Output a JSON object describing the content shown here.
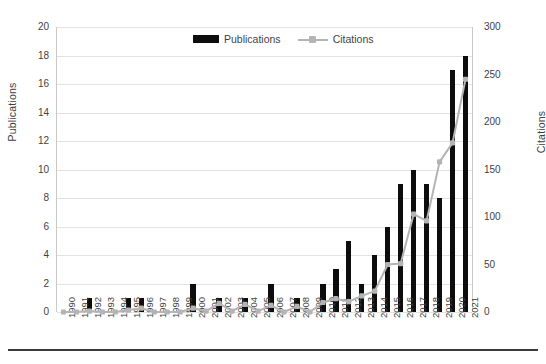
{
  "chart_data": {
    "type": "bar",
    "title": "",
    "xlabel": "",
    "ylabel": "Publications",
    "y2label": "Citations",
    "grid": true,
    "legend_position": "top-center",
    "ylim": [
      0,
      20
    ],
    "y2lim": [
      0,
      300
    ],
    "yticks": [
      0,
      2,
      4,
      6,
      8,
      10,
      12,
      14,
      16,
      18,
      20
    ],
    "y2ticks": [
      0,
      50,
      100,
      150,
      200,
      250,
      300
    ],
    "categories": [
      "1990",
      "1991",
      "1992",
      "1993",
      "1994",
      "1995",
      "1996",
      "1997",
      "1998",
      "1999",
      "2000",
      "2001",
      "2002",
      "2003",
      "2004",
      "2005",
      "2006",
      "2007",
      "2008",
      "2009",
      "2010",
      "2011",
      "2012",
      "2013",
      "2014",
      "2015",
      "2016",
      "2017",
      "2018",
      "2019",
      "2020",
      "2021"
    ],
    "series": [
      {
        "name": "Publications",
        "axis": "left",
        "type": "bar",
        "color": "#0d0d0d",
        "values": [
          0,
          0,
          1,
          0,
          0,
          1,
          1,
          0,
          0,
          0,
          2,
          0,
          1,
          0,
          1,
          0,
          2,
          0,
          1,
          0,
          2,
          3,
          5,
          2,
          4,
          6,
          9,
          10,
          9,
          8,
          17,
          18
        ]
      },
      {
        "name": "Citations",
        "axis": "right",
        "type": "line",
        "color": "#b4b4b4",
        "values": [
          0,
          0,
          1,
          0,
          0,
          2,
          4,
          0,
          0,
          0,
          4,
          1,
          9,
          1,
          8,
          1,
          7,
          0,
          6,
          0,
          10,
          14,
          11,
          17,
          22,
          50,
          51,
          103,
          96,
          158,
          178,
          245
        ]
      }
    ]
  },
  "legend": {
    "items": [
      {
        "label": "Publications",
        "marker": "bar-swatch"
      },
      {
        "label": "Citations",
        "marker": "line-swatch"
      }
    ]
  },
  "axes": {
    "left_title": "Publications",
    "right_title": "Citations"
  }
}
